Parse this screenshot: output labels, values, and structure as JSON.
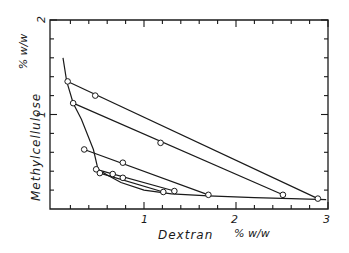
{
  "chart_data": {
    "type": "line",
    "title": "",
    "xlabel": "Dextran",
    "xunit": "% w/w",
    "ylabel": "Methylcellulose",
    "yunit": "% w/w",
    "xlim": [
      0,
      3
    ],
    "ylim": [
      0,
      2
    ],
    "xticks": [
      "1",
      "2",
      "3"
    ],
    "yticks": [
      "1",
      "2"
    ],
    "grid": false,
    "legend": "none",
    "binodal_curve": {
      "name": "binodal",
      "x": [
        0.12,
        0.16,
        0.23,
        0.32,
        0.45,
        0.5,
        0.6,
        0.75,
        1.0,
        1.3,
        1.7,
        2.2,
        2.6,
        2.98
      ],
      "y": [
        1.6,
        1.35,
        1.12,
        0.95,
        0.63,
        0.42,
        0.36,
        0.28,
        0.2,
        0.16,
        0.14,
        0.12,
        0.11,
        0.1
      ]
    },
    "series": [
      {
        "name": "tie-line 1",
        "x": [
          0.17,
          0.47,
          2.89
        ],
        "y": [
          1.35,
          1.2,
          0.11
        ]
      },
      {
        "name": "tie-line 2",
        "x": [
          0.23,
          1.18,
          2.51
        ],
        "y": [
          1.12,
          0.7,
          0.15
        ]
      },
      {
        "name": "tie-line 3",
        "x": [
          0.35,
          0.77,
          1.7
        ],
        "y": [
          0.63,
          0.49,
          0.15
        ]
      },
      {
        "name": "tie-line 4",
        "x": [
          0.48,
          0.66,
          1.33
        ],
        "y": [
          0.42,
          0.37,
          0.19
        ]
      },
      {
        "name": "tie-line 5",
        "x": [
          0.52,
          0.77,
          1.21
        ],
        "y": [
          0.38,
          0.33,
          0.18
        ]
      }
    ]
  },
  "axis": {
    "x_title": "Dextran",
    "x_unit": "% w/w",
    "y_title": "Methylcellulose",
    "y_unit": "% w/w",
    "x_tick_1": "1",
    "x_tick_2": "2",
    "x_tick_3": "3",
    "y_tick_1": "1",
    "y_tick_2": "2"
  }
}
